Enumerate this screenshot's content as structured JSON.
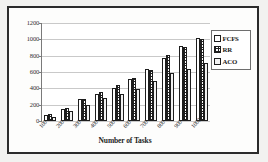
{
  "chart_data": {
    "type": "bar",
    "title": "",
    "xlabel": "Number of Tasks",
    "ylabel": "",
    "categories": [
      "100",
      "200",
      "300",
      "400",
      "500",
      "600",
      "700",
      "800",
      "900",
      "1000"
    ],
    "yticks": [
      "0",
      "200",
      "400",
      "600",
      "800",
      "1000",
      "1200"
    ],
    "ylim": [
      0,
      1200
    ],
    "grid": true,
    "legend_position": "right",
    "series": [
      {
        "name": "FCFS",
        "values": [
          70,
          145,
          265,
          330,
          410,
          515,
          635,
          775,
          920,
          1020
        ]
      },
      {
        "name": "RR",
        "values": [
          80,
          160,
          275,
          350,
          445,
          530,
          630,
          810,
          905,
          1000
        ]
      },
      {
        "name": "ACO",
        "values": [
          55,
          125,
          195,
          280,
          330,
          395,
          495,
          585,
          635,
          710
        ]
      }
    ]
  },
  "legend": {
    "items": [
      {
        "label": "FCFS"
      },
      {
        "label": "RR"
      },
      {
        "label": "ACO"
      }
    ]
  },
  "colors": {
    "frame": "#2b2b2b",
    "plot_background": "#ffffff",
    "gridline": "#c9c9c9",
    "axis": "#7a7a7a",
    "text": "#1d1d1d"
  }
}
